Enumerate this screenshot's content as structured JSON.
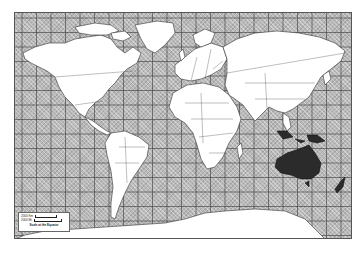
{
  "map": {
    "type": "World political outline map",
    "projection": "Mercator",
    "highlighted_region": "Australia / Oceania",
    "colors": {
      "ocean": "#b9b9b9",
      "land": "#ffffff",
      "highlight": "#2b2b2b",
      "grid": "#555555",
      "outline": "#333333"
    },
    "grid": {
      "meridian_spacing_px": 14.5,
      "parallel_spacing_px": 14.5
    }
  },
  "scale_bar": {
    "line1": "2000 Km",
    "line2": "2000 Mi",
    "caption": "Scale at the Equator",
    "_note": "line1/line2 are best guesses; text is not legible at this resolution"
  }
}
